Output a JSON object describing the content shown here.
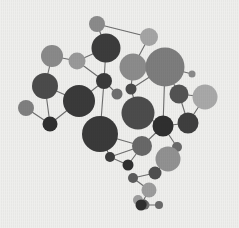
{
  "figure": {
    "background_color": "#efefed",
    "width": 239,
    "height": 228
  },
  "chart_data": {
    "type": "scatter",
    "subtype": "node-link-network",
    "title": "",
    "subtitle": "",
    "xlabel": "",
    "ylabel": "",
    "xlim": [
      0,
      239
    ],
    "ylim": [
      0,
      228
    ],
    "grid": false,
    "legend": false,
    "axes_visible": false,
    "tick_labels": [],
    "annotations": [],
    "background_color": "#efefed",
    "edge_color": "#6d6d6d",
    "edge_width": 1.1,
    "palette": [
      "#3a3a3a",
      "#5a5a5a",
      "#777777",
      "#8e8e8e",
      "#a0a0a0",
      "#b3b3b3"
    ],
    "node_count": 34,
    "edge_count": 39,
    "nodes": [
      {
        "id": "n0",
        "x": 97,
        "y": 24,
        "r": 8.0,
        "color": "#8b8b8b"
      },
      {
        "id": "n1",
        "x": 149,
        "y": 37,
        "r": 9.0,
        "color": "#a5a5a5"
      },
      {
        "id": "n2",
        "x": 106,
        "y": 48,
        "r": 14.5,
        "color": "#3c3c3c"
      },
      {
        "id": "n3",
        "x": 52,
        "y": 56,
        "r": 11.0,
        "color": "#8a8a8a"
      },
      {
        "id": "n4",
        "x": 77,
        "y": 61,
        "r": 8.5,
        "color": "#9a9a9a"
      },
      {
        "id": "n5",
        "x": 133,
        "y": 67,
        "r": 13.5,
        "color": "#8c8c8c"
      },
      {
        "id": "n6",
        "x": 165,
        "y": 67,
        "r": 19.5,
        "color": "#7d7d7d"
      },
      {
        "id": "n7",
        "x": 45,
        "y": 86,
        "r": 13.0,
        "color": "#4b4b4b"
      },
      {
        "id": "n8",
        "x": 104,
        "y": 81,
        "r": 8.0,
        "color": "#3a3a3a"
      },
      {
        "id": "n9",
        "x": 117,
        "y": 94,
        "r": 5.5,
        "color": "#6e6e6e"
      },
      {
        "id": "n10",
        "x": 131,
        "y": 89,
        "r": 5.5,
        "color": "#4a4a4a"
      },
      {
        "id": "n11",
        "x": 79,
        "y": 101,
        "r": 16.0,
        "color": "#3a3a3a"
      },
      {
        "id": "n12",
        "x": 26,
        "y": 108,
        "r": 8.0,
        "color": "#808080"
      },
      {
        "id": "n13",
        "x": 50,
        "y": 124,
        "r": 7.5,
        "color": "#2f2f2f"
      },
      {
        "id": "n14",
        "x": 179,
        "y": 94,
        "r": 9.5,
        "color": "#535353"
      },
      {
        "id": "n15",
        "x": 205,
        "y": 97,
        "r": 12.5,
        "color": "#a9a9a9"
      },
      {
        "id": "n16",
        "x": 138,
        "y": 113,
        "r": 16.5,
        "color": "#4c4c4c"
      },
      {
        "id": "n17",
        "x": 188,
        "y": 123,
        "r": 10.5,
        "color": "#3f3f3f"
      },
      {
        "id": "n18",
        "x": 100,
        "y": 134,
        "r": 18.0,
        "color": "#3a3a3a"
      },
      {
        "id": "n19",
        "x": 163,
        "y": 126,
        "r": 10.5,
        "color": "#2f2f2f"
      },
      {
        "id": "n20",
        "x": 142,
        "y": 146,
        "r": 10.0,
        "color": "#686868"
      },
      {
        "id": "n21",
        "x": 110,
        "y": 157,
        "r": 5.0,
        "color": "#3c3c3c"
      },
      {
        "id": "n22",
        "x": 128,
        "y": 165,
        "r": 5.5,
        "color": "#2f2f2f"
      },
      {
        "id": "n23",
        "x": 177,
        "y": 147,
        "r": 5.0,
        "color": "#6a6a6a"
      },
      {
        "id": "n24",
        "x": 168,
        "y": 159,
        "r": 12.5,
        "color": "#929292"
      },
      {
        "id": "n25",
        "x": 155,
        "y": 173,
        "r": 6.5,
        "color": "#4f4f4f"
      },
      {
        "id": "n26",
        "x": 133,
        "y": 178,
        "r": 5.0,
        "color": "#5c5c5c"
      },
      {
        "id": "n27",
        "x": 149,
        "y": 190,
        "r": 7.5,
        "color": "#9d9d9d"
      },
      {
        "id": "n28",
        "x": 138,
        "y": 200,
        "r": 5.0,
        "color": "#9e9e9e"
      },
      {
        "id": "n29",
        "x": 145,
        "y": 205,
        "r": 4.5,
        "color": "#6f6f6f"
      },
      {
        "id": "n30",
        "x": 144,
        "y": 203,
        "r": 3.5,
        "color": "#555555"
      },
      {
        "id": "n31",
        "x": 141,
        "y": 205,
        "r": 5.5,
        "color": "#2f2f2f"
      },
      {
        "id": "n32",
        "x": 159,
        "y": 205,
        "r": 4.0,
        "color": "#6b6b6b"
      },
      {
        "id": "n33",
        "x": 192,
        "y": 74,
        "r": 3.5,
        "color": "#8a8a8a"
      }
    ],
    "edges": [
      {
        "source": "n0",
        "target": "n1"
      },
      {
        "source": "n0",
        "target": "n2"
      },
      {
        "source": "n1",
        "target": "n5"
      },
      {
        "source": "n2",
        "target": "n4"
      },
      {
        "source": "n2",
        "target": "n8"
      },
      {
        "source": "n3",
        "target": "n4"
      },
      {
        "source": "n3",
        "target": "n7"
      },
      {
        "source": "n4",
        "target": "n8"
      },
      {
        "source": "n5",
        "target": "n6"
      },
      {
        "source": "n5",
        "target": "n10"
      },
      {
        "source": "n6",
        "target": "n10"
      },
      {
        "source": "n6",
        "target": "n14"
      },
      {
        "source": "n6",
        "target": "n19"
      },
      {
        "source": "n6",
        "target": "n33"
      },
      {
        "source": "n7",
        "target": "n11"
      },
      {
        "source": "n7",
        "target": "n13"
      },
      {
        "source": "n8",
        "target": "n9"
      },
      {
        "source": "n8",
        "target": "n11"
      },
      {
        "source": "n8",
        "target": "n18"
      },
      {
        "source": "n10",
        "target": "n16"
      },
      {
        "source": "n11",
        "target": "n13"
      },
      {
        "source": "n12",
        "target": "n13"
      },
      {
        "source": "n14",
        "target": "n15"
      },
      {
        "source": "n14",
        "target": "n17"
      },
      {
        "source": "n15",
        "target": "n17"
      },
      {
        "source": "n16",
        "target": "n19"
      },
      {
        "source": "n17",
        "target": "n19"
      },
      {
        "source": "n18",
        "target": "n20"
      },
      {
        "source": "n18",
        "target": "n21"
      },
      {
        "source": "n19",
        "target": "n20"
      },
      {
        "source": "n19",
        "target": "n23"
      },
      {
        "source": "n20",
        "target": "n21"
      },
      {
        "source": "n20",
        "target": "n22"
      },
      {
        "source": "n21",
        "target": "n22"
      },
      {
        "source": "n23",
        "target": "n24"
      },
      {
        "source": "n24",
        "target": "n25"
      },
      {
        "source": "n25",
        "target": "n26"
      },
      {
        "source": "n26",
        "target": "n27"
      },
      {
        "source": "n27",
        "target": "n31"
      },
      {
        "source": "n31",
        "target": "n32"
      }
    ]
  }
}
